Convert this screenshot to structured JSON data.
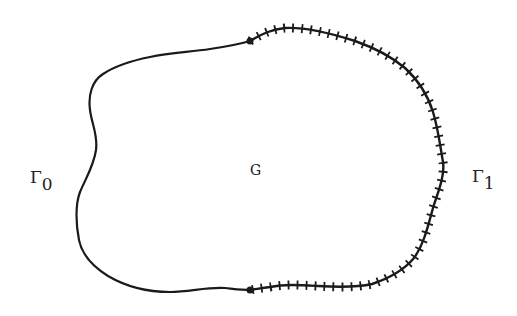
{
  "figure": {
    "labels": {
      "gamma0": {
        "main": "Γ",
        "sub": "0"
      },
      "region": "G",
      "gamma1": {
        "main": "Γ",
        "sub": "1"
      }
    },
    "colors": {
      "background": "#ffffff",
      "stroke": "#1a1a1a",
      "text": "#222222"
    }
  }
}
